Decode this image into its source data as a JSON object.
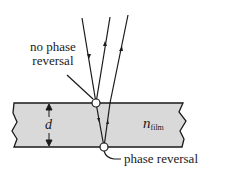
{
  "diagram": {
    "labels": {
      "top_reflection_line1": "no phase",
      "top_reflection_line2": "reversal",
      "bottom_reflection": "phase reversal",
      "thickness": "d",
      "index_symbol": "n",
      "index_subscript": "film"
    },
    "colors": {
      "film_fill": "#d9d9d9",
      "line": "#1a1a1a",
      "background": "#ffffff"
    }
  }
}
